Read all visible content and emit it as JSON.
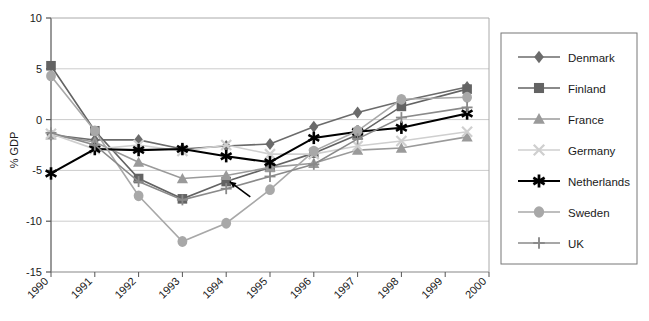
{
  "chart_data": {
    "type": "line",
    "title": "",
    "xlabel": "",
    "ylabel": "% GDP",
    "x": [
      1990,
      1991,
      1992,
      1993,
      1994,
      1995,
      1996,
      1997,
      1998,
      1999.5
    ],
    "xticklabels": [
      "1990",
      "1991",
      "1992",
      "1993",
      "1994",
      "1995",
      "1996",
      "1997",
      "1998",
      "1999",
      "2000"
    ],
    "xlim": [
      1990,
      2000
    ],
    "ylim": [
      -15,
      10
    ],
    "yticklabels": [
      "10",
      "5",
      "0",
      "-5",
      "-10",
      "-15"
    ],
    "yticks": [
      10,
      5,
      0,
      -5,
      -10,
      -15
    ],
    "grid": true,
    "legend_position": "right",
    "series": [
      {
        "name": "Denmark",
        "marker": "diamond",
        "color": "#6b6b6b",
        "values": [
          -1.5,
          -2.0,
          -2.0,
          -2.9,
          -2.6,
          -2.4,
          -0.7,
          0.7,
          1.8,
          3.2
        ]
      },
      {
        "name": "Finland",
        "marker": "square",
        "color": "#636363",
        "values": [
          5.3,
          -1.1,
          -5.8,
          -7.8,
          -6.1,
          -4.7,
          -3.3,
          -1.5,
          1.3,
          3.0
        ]
      },
      {
        "name": "France",
        "marker": "triangle",
        "color": "#9a9a9a",
        "values": [
          -1.5,
          -2.2,
          -4.2,
          -5.8,
          -5.5,
          -4.7,
          -4.3,
          -3.0,
          -2.8,
          -1.7
        ]
      },
      {
        "name": "Germany",
        "marker": "x",
        "color": "#cfcfcf",
        "values": [
          -1.4,
          -2.9,
          -2.5,
          -3.1,
          -2.5,
          -3.4,
          -3.4,
          -2.6,
          -2.1,
          -1.2
        ]
      },
      {
        "name": "Netherlands",
        "marker": "asterisk",
        "color": "#000000",
        "values": [
          -5.3,
          -2.9,
          -3.0,
          -2.9,
          -3.6,
          -4.2,
          -1.8,
          -1.2,
          -0.8,
          0.6
        ]
      },
      {
        "name": "Sweden",
        "marker": "circle",
        "color": "#a8a8a8",
        "values": [
          4.3,
          -1.1,
          -7.5,
          -12.0,
          -10.2,
          -6.9,
          -3.1,
          -1.1,
          2.0,
          2.2
        ]
      },
      {
        "name": "UK",
        "marker": "plus",
        "color": "#8a8a8a",
        "values": [
          -1.3,
          -2.5,
          -6.1,
          -7.9,
          -6.8,
          -5.6,
          -4.4,
          -1.9,
          0.2,
          1.2
        ]
      }
    ],
    "annotations": [
      {
        "name": "pointer-arrow",
        "type": "arrow",
        "from_x": 1994.55,
        "from_y": -7.6,
        "to_x": 1994.08,
        "to_y": -6.1
      }
    ]
  },
  "legend": {
    "items": [
      {
        "label": "Denmark"
      },
      {
        "label": "Finland"
      },
      {
        "label": "France"
      },
      {
        "label": "Germany"
      },
      {
        "label": "Netherlands"
      },
      {
        "label": "Sweden"
      },
      {
        "label": "UK"
      }
    ]
  },
  "colors": {
    "axis": "#555555",
    "grid": "#cccccc",
    "background": "#ffffff",
    "text": "#1a1a1a"
  }
}
